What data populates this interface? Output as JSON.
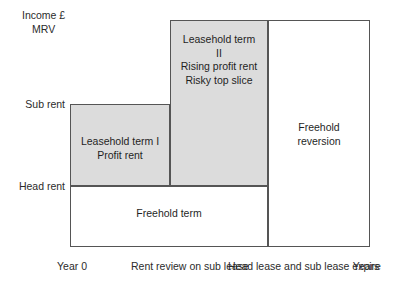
{
  "axes": {
    "y_title_line1": "Income £",
    "y_title_line2": "MRV",
    "y_ticks": [
      {
        "label": "Sub rent"
      },
      {
        "label": "Head rent"
      }
    ],
    "x_ticks": [
      {
        "line1": "Year 0",
        "line2": ""
      },
      {
        "line1": "Rent review",
        "line2": "on sub lease"
      },
      {
        "line1": "Head lease and",
        "line2": "sub lease expire"
      },
      {
        "line1": "Years",
        "line2": ""
      }
    ]
  },
  "blocks": {
    "leasehold_1": {
      "line1": "Leasehold term I",
      "line2": "Profit rent",
      "fill": "#dcdcdc"
    },
    "leasehold_2": {
      "line1": "Leasehold term",
      "line2": "II",
      "line3": "Rising profit rent",
      "line4": "Risky top slice",
      "fill": "#dcdcdc"
    },
    "freehold_reversion": {
      "line1": "Freehold",
      "line2": "reversion",
      "fill": "#ffffff"
    },
    "freehold_term": {
      "line1": "Freehold term",
      "fill": "#ffffff"
    }
  },
  "chart_data": {
    "type": "area",
    "title": "",
    "xlabel": "Years",
    "ylabel": "Income £ MRV",
    "x_tick_labels": [
      "Year 0",
      "Rent review on sub lease",
      "Head lease and sub lease expire",
      "Years"
    ],
    "y_tick_labels": [
      "Head rent",
      "Sub rent",
      "MRV"
    ],
    "regions": [
      {
        "name": "Leasehold term I / Profit rent",
        "x0": 0,
        "x1": 1,
        "y0": "Head rent",
        "y1": "Sub rent",
        "fill": "#dcdcdc"
      },
      {
        "name": "Leasehold term II / Rising profit rent / Risky top slice",
        "x0": 1,
        "x1": 2,
        "y0": "Head rent",
        "y1": "MRV",
        "fill": "#dcdcdc"
      },
      {
        "name": "Freehold term",
        "x0": 0,
        "x1": 2,
        "y0": 0,
        "y1": "Head rent",
        "fill": "#ffffff"
      },
      {
        "name": "Freehold reversion",
        "x0": 2,
        "x1": 3,
        "y0": 0,
        "y1": "MRV",
        "fill": "#ffffff"
      }
    ]
  }
}
